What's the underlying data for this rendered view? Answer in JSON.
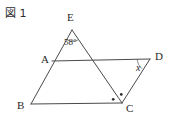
{
  "figure": {
    "caption": "図 1",
    "stroke_color": "#4a4a4a",
    "text_color": "#2b2b2b",
    "background_color": "#ffffff",
    "width": 171,
    "height": 123,
    "vertices": [
      {
        "name": "E",
        "label": "E",
        "x": 72,
        "y": 30
      },
      {
        "name": "A",
        "label": "A",
        "x": 52,
        "y": 61
      },
      {
        "name": "D",
        "label": "D",
        "x": 150,
        "y": 59
      },
      {
        "name": "B",
        "label": "B",
        "x": 31,
        "y": 104
      },
      {
        "name": "C",
        "label": "C",
        "x": 122,
        "y": 103
      }
    ],
    "segments": [
      {
        "name": "segment-E-B",
        "from": "E",
        "to": "B"
      },
      {
        "name": "segment-E-C",
        "from": "E",
        "to": "C"
      },
      {
        "name": "segment-A-D",
        "from": "A",
        "to": "D"
      },
      {
        "name": "segment-B-C",
        "from": "B",
        "to": "C"
      },
      {
        "name": "segment-C-D",
        "from": "C",
        "to": "D"
      }
    ],
    "angles": [
      {
        "name": "angle-at-E",
        "vertex": "E",
        "label": "58°",
        "value": 58,
        "unit": "degrees",
        "marker": "arc"
      },
      {
        "name": "angle-at-D",
        "vertex": "D",
        "label": "x",
        "value": null,
        "unit": "degrees",
        "marker": "arc"
      },
      {
        "name": "angle-B-C-E",
        "vertex": "C",
        "label": "",
        "value": null,
        "marker": "dot"
      },
      {
        "name": "angle-E-C-D",
        "vertex": "C",
        "label": "",
        "value": null,
        "marker": "dot"
      }
    ]
  }
}
